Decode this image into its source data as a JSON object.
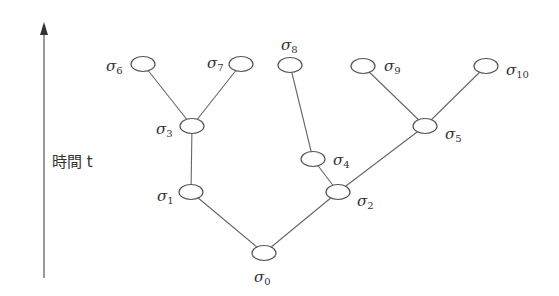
{
  "axis": {
    "label": "時間 t",
    "direction": "up"
  },
  "nodes": [
    {
      "id": "σ0",
      "sub": "0",
      "cx": 264,
      "cy": 253,
      "lx": 254,
      "ly": 282
    },
    {
      "id": "σ1",
      "sub": "1",
      "cx": 191,
      "cy": 192,
      "lx": 157,
      "ly": 201
    },
    {
      "id": "σ2",
      "sub": "2",
      "cx": 338,
      "cy": 192,
      "lx": 357,
      "ly": 206
    },
    {
      "id": "σ3",
      "sub": "3",
      "cx": 192,
      "cy": 126,
      "lx": 156,
      "ly": 134
    },
    {
      "id": "σ4",
      "sub": "4",
      "cx": 313,
      "cy": 159,
      "lx": 333,
      "ly": 165
    },
    {
      "id": "σ5",
      "sub": "5",
      "cx": 425,
      "cy": 126,
      "lx": 445,
      "ly": 139
    },
    {
      "id": "σ6",
      "sub": "6",
      "cx": 143,
      "cy": 64,
      "lx": 106,
      "ly": 71
    },
    {
      "id": "σ7",
      "sub": "7",
      "cx": 241,
      "cy": 64,
      "lx": 207,
      "ly": 68
    },
    {
      "id": "σ8",
      "sub": "8",
      "cx": 290,
      "cy": 65,
      "lx": 281,
      "ly": 50
    },
    {
      "id": "σ9",
      "sub": "9",
      "cx": 363,
      "cy": 66,
      "lx": 384,
      "ly": 71
    },
    {
      "id": "σ10",
      "sub": "10",
      "cx": 486,
      "cy": 66,
      "lx": 506,
      "ly": 75
    }
  ],
  "edges": [
    [
      "σ0",
      "σ1"
    ],
    [
      "σ0",
      "σ2"
    ],
    [
      "σ1",
      "σ3"
    ],
    [
      "σ2",
      "σ4"
    ],
    [
      "σ2",
      "σ5"
    ],
    [
      "σ3",
      "σ6"
    ],
    [
      "σ3",
      "σ7"
    ],
    [
      "σ4",
      "σ8"
    ],
    [
      "σ5",
      "σ9"
    ],
    [
      "σ5",
      "σ10"
    ]
  ]
}
